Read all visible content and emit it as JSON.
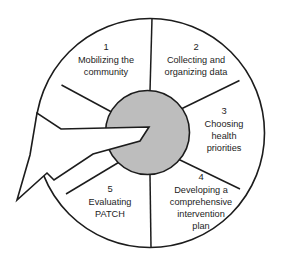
{
  "diagram": {
    "colors": {
      "hub_fill": "#bdbdbd",
      "hub_stroke": "#1c1c1c",
      "wheel_stroke": "#1c1c1c",
      "wheel_fill": "#ffffff",
      "arrow_fill": "#ffffff",
      "arrow_stroke": "#1c1c1c",
      "text": "#1c1c1c"
    },
    "hub": {
      "label": ""
    },
    "arrow": {
      "name": "entry-arrow",
      "direction": "down-left"
    },
    "segments": [
      {
        "number": "1",
        "lines": [
          "Mobilizing the",
          "community"
        ],
        "line1": "Mobilizing the",
        "line2": "community",
        "line3": "",
        "line4": ""
      },
      {
        "number": "2",
        "lines": [
          "Collecting and",
          "organizing data"
        ],
        "line1": "Collecting and",
        "line2": "organizing data",
        "line3": "",
        "line4": ""
      },
      {
        "number": "3",
        "lines": [
          "Choosing",
          "health",
          "priorities"
        ],
        "line1": "Choosing",
        "line2": "health",
        "line3": "priorities",
        "line4": ""
      },
      {
        "number": "4",
        "lines": [
          "Developing a",
          "comprehensive",
          "intervention",
          "plan"
        ],
        "line1": "Developing a",
        "line2": "comprehensive",
        "line3": "intervention",
        "line4": "plan"
      },
      {
        "number": "5",
        "lines": [
          "Evaluating",
          "PATCH"
        ],
        "line1": "Evaluating",
        "line2": "PATCH",
        "line3": "",
        "line4": ""
      }
    ]
  }
}
